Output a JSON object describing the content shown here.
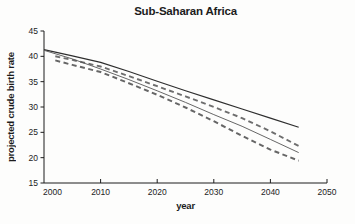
{
  "chart_data": {
    "type": "line",
    "title": "Sub-Saharan Africa",
    "xlabel": "year",
    "ylabel": "projected crude birth rate",
    "xlim": [
      2000,
      2050
    ],
    "ylim": [
      15,
      45
    ],
    "x_ticks": [
      2000,
      2010,
      2020,
      2030,
      2040,
      2050
    ],
    "y_ticks": [
      45,
      40,
      35,
      30,
      25,
      20,
      15
    ],
    "grid": false,
    "legend": "none",
    "axis_color": "#1c1c1c",
    "series": [
      {
        "name": "projection-upper-solid",
        "style": {
          "stroke": "#2e2e2e",
          "width": 1.2,
          "dash": ""
        },
        "x": [
          2000,
          2005,
          2010,
          2015,
          2020,
          2025,
          2030,
          2035,
          2040,
          2045
        ],
        "y": [
          41.3,
          40.1,
          38.8,
          37.0,
          35.1,
          33.2,
          31.4,
          29.6,
          27.8,
          26.0
        ]
      },
      {
        "name": "projection-upper-dashed",
        "style": {
          "stroke": "#6e6e6e",
          "width": 1.9,
          "dash": "5,3.5"
        },
        "x": [
          2002,
          2005,
          2010,
          2015,
          2020,
          2025,
          2030,
          2035,
          2040,
          2045
        ],
        "y": [
          40.0,
          39.3,
          38.0,
          36.1,
          34.1,
          32.1,
          30.0,
          27.8,
          25.2,
          22.3
        ]
      },
      {
        "name": "projection-thin-solid",
        "style": {
          "stroke": "#555555",
          "width": 0.9,
          "dash": ""
        },
        "x": [
          2000,
          2005,
          2010,
          2015,
          2020,
          2025,
          2030,
          2035,
          2040,
          2045
        ],
        "y": [
          41.2,
          39.5,
          37.5,
          35.4,
          33.2,
          30.9,
          28.5,
          26.2,
          23.6,
          21.0
        ]
      },
      {
        "name": "projection-lower-dashed",
        "style": {
          "stroke": "#666666",
          "width": 2.0,
          "dash": "5,3.5"
        },
        "x": [
          2002,
          2005,
          2010,
          2015,
          2020,
          2025,
          2030,
          2035,
          2040,
          2045
        ],
        "y": [
          39.2,
          38.3,
          36.9,
          34.7,
          32.4,
          29.9,
          27.2,
          24.3,
          21.6,
          19.4
        ]
      }
    ]
  }
}
